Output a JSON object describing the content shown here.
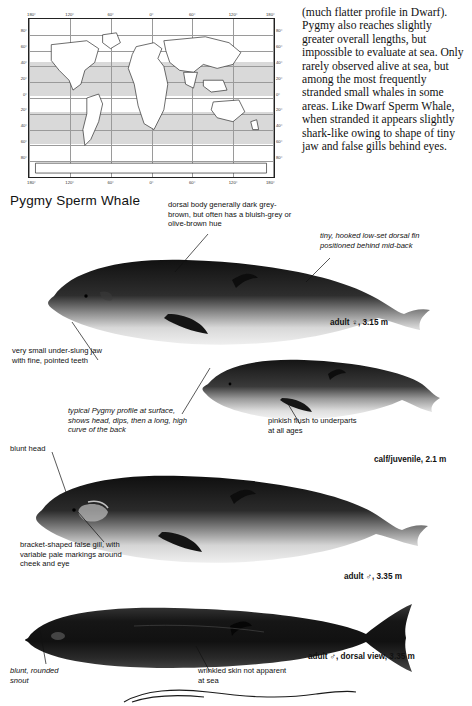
{
  "page": {
    "species_title": "Pygmy Sperm Whale",
    "body_text": "(much flatter profile in Dwarf). Pygmy also reaches slightly greater overall lengths, but impossible to evaluate at sea. Only rarely observed alive at sea, but among the most frequently stranded small whales in some areas. Like Dwarf Sperm Whale, when stranded it appears slightly shark-like owing to shape of tiny jaw and false gills behind eyes."
  },
  "map": {
    "lat_labels": [
      "80°",
      "60°",
      "40°",
      "20°",
      "0°",
      "20°",
      "40°",
      "60°",
      "80°"
    ],
    "lon_labels": [
      "180°",
      "120°",
      "60°",
      "0°",
      "60°",
      "120°",
      "180°"
    ],
    "lon_labels_bottom": [
      "180°",
      "120°",
      "60°",
      "0°",
      "60°",
      "120°",
      "180°"
    ]
  },
  "annotations": {
    "dorsal_body": "dorsal body generally dark grey-brown, but often has a bluish-grey or olive-brown hue",
    "dorsal_fin": "tiny, hooked low-set dorsal fin positioned behind mid-back",
    "adult_female": "adult ♀, 3.15 m",
    "very_small_jaw": "very small under-slung jaw with fine, pointed teeth",
    "typical_profile": "typical Pygmy profile at surface, shows head, dips, then a long, high curve of the back",
    "pinkish_flush": "pinkish flush to underparts at all ages",
    "calf_juvenile": "calf/juvenile, 2.1 m",
    "blunt_head": "blunt head",
    "false_gill": "bracket-shaped false gill, with variable pale markings around cheek and eye",
    "adult_male": "adult ♂, 3.35 m",
    "blunt_rounded_snout": "blunt, rounded snout",
    "wrinkled_skin": "wrinkled skin not apparent at sea",
    "adult_male_dorsal": "adult ♂, dorsal view, 3.35 m"
  },
  "colors": {
    "body_dark": "#1b1b1b",
    "body_mid": "#6d6d6d",
    "body_light": "#cfcfcf",
    "map_band": "#d9d9d9",
    "ink": "#111111"
  }
}
